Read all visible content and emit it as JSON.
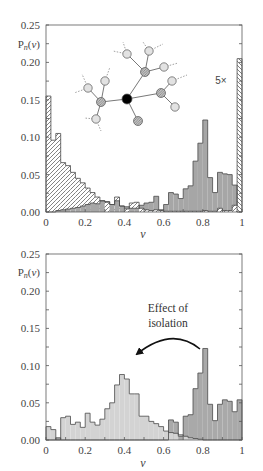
{
  "figure": {
    "top_panel": {
      "ylabel": {
        "main": "P",
        "sub": "n",
        "open": "(",
        "arg": "v",
        "close": ")"
      },
      "xlabel": "v",
      "scale_note": "5×"
    },
    "bottom_panel": {
      "ylabel": {
        "main": "P",
        "sub": "n",
        "open": "(",
        "arg": "v",
        "close": ")"
      },
      "xlabel": "v",
      "annotation_line1": "Effect of",
      "annotation_line2": "isolation"
    }
  },
  "inset_network": {
    "nodes": [
      {
        "id": "c",
        "x": 127,
        "y": 99,
        "type": "center"
      },
      {
        "id": "h1",
        "x": 101,
        "y": 102,
        "type": "hatched"
      },
      {
        "id": "h2",
        "x": 145,
        "y": 72,
        "type": "hatched"
      },
      {
        "id": "h3",
        "x": 161,
        "y": 93,
        "type": "hatched"
      },
      {
        "id": "h4",
        "x": 138,
        "y": 121,
        "type": "hatched"
      },
      {
        "id": "l1",
        "x": 88,
        "y": 88,
        "type": "light"
      },
      {
        "id": "l2",
        "x": 105,
        "y": 81,
        "type": "light"
      },
      {
        "id": "l3",
        "x": 96,
        "y": 119,
        "type": "light"
      },
      {
        "id": "l4",
        "x": 127,
        "y": 54,
        "type": "light"
      },
      {
        "id": "l5",
        "x": 149,
        "y": 51,
        "type": "light"
      },
      {
        "id": "l6",
        "x": 164,
        "y": 67,
        "type": "light"
      },
      {
        "id": "l7",
        "x": 172,
        "y": 81,
        "type": "light"
      },
      {
        "id": "l8",
        "x": 175,
        "y": 107,
        "type": "light"
      }
    ],
    "edges": [
      [
        "c",
        "h1"
      ],
      [
        "c",
        "h2"
      ],
      [
        "c",
        "h3"
      ],
      [
        "c",
        "h4"
      ],
      [
        "h1",
        "l1"
      ],
      [
        "h1",
        "l2"
      ],
      [
        "h1",
        "l3"
      ],
      [
        "h2",
        "l4"
      ],
      [
        "h2",
        "l5"
      ],
      [
        "h2",
        "l6"
      ],
      [
        "h3",
        "l7"
      ],
      [
        "h3",
        "l8"
      ]
    ],
    "stubs": [
      [
        88,
        88,
        82,
        74
      ],
      [
        88,
        88,
        74,
        93
      ],
      [
        105,
        81,
        110,
        67
      ],
      [
        96,
        119,
        84,
        118
      ],
      [
        96,
        119,
        101,
        131
      ],
      [
        127,
        54,
        123,
        42
      ],
      [
        127,
        54,
        113,
        51
      ],
      [
        149,
        51,
        143,
        42
      ],
      [
        149,
        51,
        163,
        44
      ],
      [
        164,
        67,
        178,
        63
      ],
      [
        172,
        81,
        187,
        75
      ]
    ]
  },
  "chart_data": [
    {
      "type": "bar",
      "subtype": "histogram",
      "panel": "top",
      "title": "",
      "xlabel": "v",
      "ylabel": "Pn(v)",
      "xlim": [
        0,
        1
      ],
      "ylim": [
        0,
        0.25
      ],
      "bin_width": 0.025,
      "xticks": [
        0,
        0.2,
        0.4,
        0.6,
        0.8,
        1
      ],
      "xtick_labels": [
        "0",
        "0.2",
        "0.4",
        "0.6",
        "0.8",
        "1"
      ],
      "yticks": [
        0,
        0.05,
        0.1,
        0.15,
        0.2,
        0.25
      ],
      "ytick_labels": [
        "0.00",
        "0.05",
        "0.10",
        "0.15",
        "0.20",
        "0.25"
      ],
      "grid": false,
      "legend": null,
      "series": [
        {
          "name": "hatched",
          "values": [
            0.155,
            0.096,
            0.105,
            0.066,
            0.062,
            0.053,
            0.045,
            0.039,
            0.032,
            0.026,
            0.02,
            0.015,
            0.013,
            0.01,
            0.02,
            0.008,
            0.004,
            0.012,
            0.013,
            0.005,
            0.003,
            0.002,
            0.003,
            0.002,
            0.001,
            0.001,
            0.001,
            0.001,
            0.001,
            0.001,
            0.001,
            0.001,
            0.002,
            0.001,
            0.001,
            0.005,
            0.002,
            0.002,
            0.009,
            0.205
          ]
        },
        {
          "name": "gray",
          "values": [
            0,
            0,
            0.002,
            0.003,
            0.004,
            0.005,
            0.006,
            0.008,
            0.01,
            0.012,
            0.011,
            0.015,
            0.014,
            0.01,
            0.015,
            0.008,
            0.007,
            0.005,
            0.005,
            0.009,
            0.012,
            0.013,
            0.021,
            0.003,
            0.01,
            0.026,
            0.024,
            0.018,
            0.031,
            0.035,
            0.068,
            0.092,
            0.123,
            0.046,
            0.026,
            0.053,
            0.051,
            0.05,
            0.036,
            0
          ]
        }
      ],
      "annotations": [
        {
          "text": "5×",
          "target": "last hatched bin (v = 0.975–1) shown scaled"
        }
      ],
      "inset": "network diagram: black central node linked to 4 hatched nodes, each linked to light nodes with dashed stubs"
    },
    {
      "type": "bar",
      "subtype": "histogram",
      "panel": "bottom",
      "title": "",
      "xlabel": "v",
      "ylabel": "Pn(v)",
      "xlim": [
        0,
        1
      ],
      "ylim": [
        0,
        0.25
      ],
      "bin_width": 0.025,
      "xticks": [
        0,
        0.2,
        0.4,
        0.6,
        0.8,
        1
      ],
      "xtick_labels": [
        "0",
        "0.2",
        "0.4",
        "0.6",
        "0.8",
        "1"
      ],
      "yticks": [
        0,
        0.05,
        0.1,
        0.15,
        0.2,
        0.25
      ],
      "ytick_labels": [
        "0.00",
        "0.05",
        "0.10",
        "0.15",
        "0.20",
        "0.25"
      ],
      "grid": false,
      "legend": null,
      "series": [
        {
          "name": "light",
          "values": [
            0.018,
            0.014,
            0,
            0.03,
            0.032,
            0.021,
            0.024,
            0.017,
            0.036,
            0.024,
            0.02,
            0.028,
            0.042,
            0.05,
            0.074,
            0.088,
            0.082,
            0.062,
            0.062,
            0.032,
            0.032,
            0.025,
            0.022,
            0.018,
            0.012,
            0.01,
            0.009,
            0.007,
            0.005,
            0.003,
            0.002,
            0.001,
            0,
            0,
            0,
            0,
            0,
            0,
            0,
            0
          ]
        },
        {
          "name": "dark",
          "values": [
            0,
            0,
            0.003,
            0,
            0,
            0,
            0,
            0,
            0,
            0,
            0,
            0,
            0,
            0,
            0,
            0,
            0,
            0,
            0,
            0,
            0,
            0,
            0,
            0,
            0,
            0.027,
            0.024,
            0.005,
            0.032,
            0.034,
            0.069,
            0.09,
            0.123,
            0.048,
            0.026,
            0.048,
            0.054,
            0.052,
            0.038,
            0.054
          ]
        }
      ],
      "annotations": [
        {
          "text": "Effect of isolation",
          "arrow_from_v": 0.79,
          "arrow_to_v": 0.45
        }
      ]
    }
  ]
}
